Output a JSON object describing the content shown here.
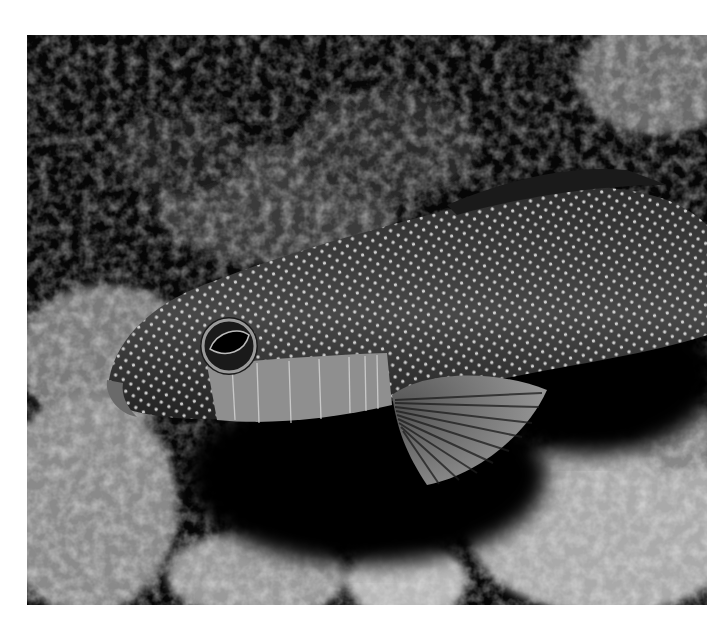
{
  "image": {
    "subject": "Spotted grouper fish resting on coral reef",
    "alt": "Black-and-white underwater photograph of a white-spotted grouper-like fish lying among reef rocks and coral",
    "palette": {
      "background": "#ffffff",
      "shadow": "#050505",
      "fish_body": "#4a4a4a",
      "fish_belly": "#9a9a9a",
      "spots": "#e8e8e8",
      "coral_light": "#d0d0d0",
      "coral_mid": "#7a7a7a"
    },
    "elements": [
      {
        "name": "fish-body",
        "description": "elongated body covered in small white spots"
      },
      {
        "name": "fish-eye",
        "description": "large dark eye with pale ring"
      },
      {
        "name": "gill-cover",
        "description": "pale banded gill/cheek region"
      },
      {
        "name": "pectoral-fin",
        "description": "fan-shaped striated pectoral fin"
      },
      {
        "name": "coral-reef",
        "description": "textured light reef rocks in lower corners and upper area"
      }
    ]
  }
}
